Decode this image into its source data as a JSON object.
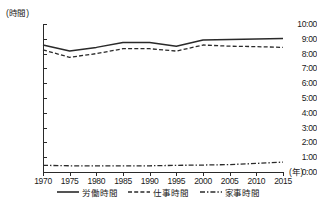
{
  "chart_data": {
    "type": "line",
    "title": "",
    "xlabel": "(年)",
    "ylabel": "(時間)",
    "x": [
      1970,
      1975,
      1980,
      1985,
      1990,
      1995,
      2000,
      2005,
      2010,
      2015
    ],
    "xtick_labels": [
      "1970",
      "1975",
      "1980",
      "1985",
      "1990",
      "1995",
      "2000",
      "2005",
      "2010",
      "2015"
    ],
    "ytick_labels": [
      "0:00",
      "1:00",
      "2:00",
      "3:00",
      "4:00",
      "5:00",
      "6:00",
      "7:00",
      "8:00",
      "9:00",
      "10:00"
    ],
    "ytick_values": [
      0,
      1,
      2,
      3,
      4,
      5,
      6,
      7,
      8,
      9,
      10
    ],
    "ylim": [
      0,
      10
    ],
    "xlim": [
      1970,
      2015
    ],
    "grid": false,
    "legend_position": "bottom-center",
    "series": [
      {
        "name": "労働時間",
        "style": "solid",
        "color": "#2a2a2a",
        "values": [
          8.58,
          8.17,
          8.42,
          8.75,
          8.75,
          8.5,
          8.92,
          8.95,
          8.98,
          9.02
        ]
      },
      {
        "name": "仕事時間",
        "style": "dashed",
        "color": "#2a2a2a",
        "values": [
          8.25,
          7.75,
          8.0,
          8.33,
          8.33,
          8.17,
          8.58,
          8.5,
          8.47,
          8.42
        ]
      },
      {
        "name": "家事時間",
        "style": "dashdot",
        "color": "#2a2a2a",
        "values": [
          0.45,
          0.42,
          0.42,
          0.42,
          0.42,
          0.45,
          0.47,
          0.5,
          0.58,
          0.67
        ]
      }
    ]
  },
  "legend": {
    "items": [
      {
        "label": "労働時間"
      },
      {
        "label": "仕事時間"
      },
      {
        "label": "家事時間"
      }
    ]
  },
  "axes": {
    "y_unit_label": "(時間)",
    "x_unit_label": "(年)"
  }
}
